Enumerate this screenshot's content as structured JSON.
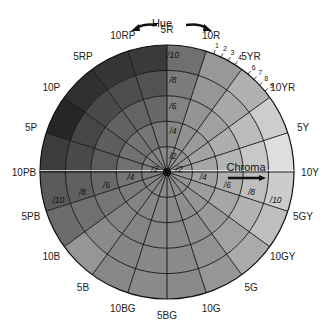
{
  "diagram": {
    "hue_axis_label": "Hue",
    "chroma_axis_label": "Chroma",
    "center": {
      "x": 167,
      "y": 172
    },
    "radius": 127,
    "hues": [
      {
        "label": "10Y",
        "angle": 0
      },
      {
        "label": "5Y",
        "angle": 18
      },
      {
        "label": "10YR",
        "angle": 36
      },
      {
        "label": "5YR",
        "angle": 54
      },
      {
        "label": "10R",
        "angle": 72
      },
      {
        "label": "5R",
        "angle": 90
      },
      {
        "label": "10RP",
        "angle": 108
      },
      {
        "label": "5RP",
        "angle": 126
      },
      {
        "label": "10P",
        "angle": 144
      },
      {
        "label": "5P",
        "angle": 162
      },
      {
        "label": "10PB",
        "angle": 180
      },
      {
        "label": "5PB",
        "angle": 198
      },
      {
        "label": "10B",
        "angle": 216
      },
      {
        "label": "5B",
        "angle": 234
      },
      {
        "label": "10BG",
        "angle": 252
      },
      {
        "label": "5BG",
        "angle": 270
      },
      {
        "label": "10G",
        "angle": 288
      },
      {
        "label": "5G",
        "angle": 306
      },
      {
        "label": "10GY",
        "angle": 324
      },
      {
        "label": "5GY",
        "angle": 342
      }
    ],
    "intermediate_ticks": {
      "between_10R_5YR": [
        "1",
        "2",
        "3",
        "4"
      ],
      "between_5YR_10YR": [
        "6",
        "7",
        "8",
        "9"
      ]
    },
    "chroma_rings": [
      "/2",
      "/4",
      "/6",
      "/8",
      "/10"
    ],
    "chroma_labels_5R": [
      "/2",
      "/4",
      "/6",
      "/8",
      "/10"
    ],
    "chroma_labels_5GY": [
      "/2",
      "/4",
      "/6",
      "/8",
      "/10"
    ],
    "chroma_labels_5PB": [
      "/2",
      "/4",
      "/6",
      "/8",
      "/10"
    ],
    "sector_shades": [
      [
        "#9a9a9a",
        "#a6a6a6",
        "#b4b4b4",
        "#c8c8c8",
        "#dedede"
      ],
      [
        "#989898",
        "#a2a2a2",
        "#aeaeae",
        "#bcbcbc",
        "#cdcdcd"
      ],
      [
        "#949494",
        "#9a9a9a",
        "#a0a0a0",
        "#a8a8a8",
        "#b0b0b0"
      ],
      [
        "#909090",
        "#929292",
        "#949494",
        "#969696",
        "#989898"
      ],
      [
        "#8c8c8c",
        "#888888",
        "#848484",
        "#7c7c7c",
        "#707070"
      ],
      [
        "#888888",
        "#7a7a7a",
        "#686868",
        "#525252",
        "#3a3a3a"
      ],
      [
        "#868686",
        "#767676",
        "#646464",
        "#4e4e4e",
        "#363636"
      ],
      [
        "#848484",
        "#747474",
        "#626262",
        "#4a4a4a",
        "#303030"
      ],
      [
        "#828282",
        "#727272",
        "#5e5e5e",
        "#464646",
        "#262626"
      ],
      [
        "#808080",
        "#707070",
        "#5c5c5c",
        "#4a4a4a",
        "#3c3c3c"
      ],
      [
        "#808080",
        "#767676",
        "#6a6a6a",
        "#606060",
        "#5a5a5a"
      ],
      [
        "#828282",
        "#7c7c7c",
        "#767676",
        "#707070",
        "#6c6c6c"
      ],
      [
        "#868686",
        "#848484",
        "#848484",
        "#8a8a8a",
        "#969696"
      ],
      [
        "#888888",
        "#868686",
        "#848484",
        "#868686",
        "#888888"
      ],
      [
        "#8a8a8a",
        "#888888",
        "#888888",
        "#888888",
        "#8a8a8a"
      ],
      [
        "#8a8a8a",
        "#8a8a8a",
        "#8a8a8a",
        "#8a8a8a",
        "#8a8a8a"
      ],
      [
        "#8c8c8c",
        "#8e8e8e",
        "#909090",
        "#929292",
        "#969696"
      ],
      [
        "#909090",
        "#949494",
        "#9a9a9a",
        "#a2a2a2",
        "#aaaaaa"
      ],
      [
        "#949494",
        "#9c9c9c",
        "#a6a6a6",
        "#b2b2b2",
        "#bebebe"
      ],
      [
        "#989898",
        "#a2a2a2",
        "#b0b0b0",
        "#bebebe",
        "#cccccc"
      ]
    ],
    "colors": {
      "line": "#111111",
      "highlight_line": "#eeeeee",
      "text": "#222222",
      "arrow": "#111111"
    }
  }
}
